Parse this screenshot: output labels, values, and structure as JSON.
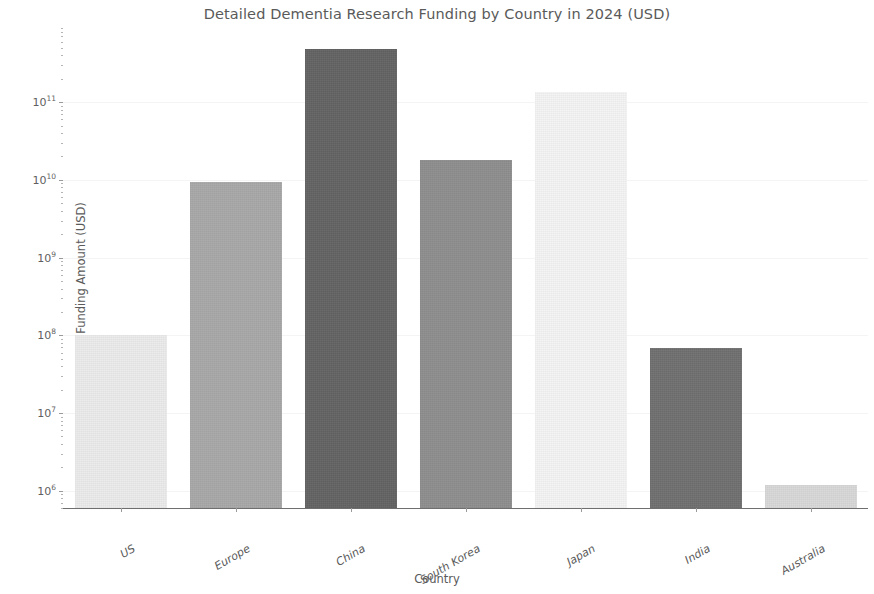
{
  "chart_data": {
    "type": "bar",
    "title": "Detailed Dementia Research Funding by Country in 2024 (USD)",
    "xlabel": "Country",
    "ylabel": "Funding Amount (USD)",
    "yscale": "log",
    "ylim": [
      600000,
      900000000000
    ],
    "grid": false,
    "legend": null,
    "categories": [
      "US",
      "Europe",
      "China",
      "South Korea",
      "Japan",
      "India",
      "Australia"
    ],
    "values": [
      100000000,
      9300000000,
      490000000000,
      18000000000,
      135000000000,
      69000000,
      1200000
    ],
    "value_labels": [
      "1.0e8",
      "9.3e9",
      "4.9e11",
      "1.8e10",
      "1.35e11",
      "6.9e7",
      "1.2e6"
    ],
    "bar_colors": [
      "#ebebeb",
      "#a8a8a8",
      "#636363",
      "#8e8e8e",
      "#f4f4f4",
      "#707070",
      "#d8d8d8"
    ],
    "ytick_labels": [
      "10⁶",
      "10⁷",
      "10⁸",
      "10⁹",
      "10¹⁰",
      "10¹¹"
    ],
    "ytick_mantissas": [
      "10",
      "10",
      "10",
      "10",
      "10",
      "10"
    ],
    "ytick_exponents": [
      "6",
      "7",
      "8",
      "9",
      "10",
      "11"
    ],
    "ytick_values": [
      1000000,
      10000000,
      100000000,
      1000000000,
      10000000000,
      100000000000
    ]
  },
  "axes": {
    "y_title": "Funding Amount (USD)",
    "x_title": "Country"
  },
  "colors": {
    "background": "#ffffff",
    "text": "#5a5a5a",
    "axis": "#6f6f6f",
    "tick": "#9a9a9a"
  }
}
